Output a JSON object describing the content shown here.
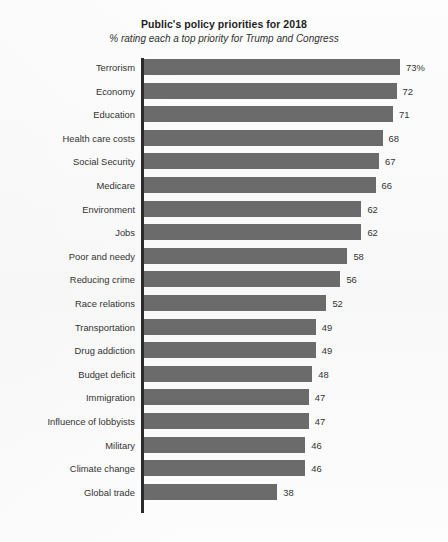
{
  "chart_data": {
    "type": "bar",
    "title": "Public's policy priorities for 2018",
    "subtitle": "% rating each a top priority for Trump and Congress",
    "orientation": "horizontal",
    "xlabel": "",
    "ylabel": "",
    "xlim": [
      0,
      73
    ],
    "grid": false,
    "legend": null,
    "bar_color": "#6b6b6b",
    "axis_color": "#2b2b2b",
    "categories": [
      "Terrorism",
      "Economy",
      "Education",
      "Health care costs",
      "Social Security",
      "Medicare",
      "Environment",
      "Jobs",
      "Poor and needy",
      "Reducing crime",
      "Race relations",
      "Transportation",
      "Drug addiction",
      "Budget deficit",
      "Immigration",
      "Influence of lobbyists",
      "Military",
      "Climate change",
      "Global trade"
    ],
    "values": [
      73,
      72,
      71,
      68,
      67,
      66,
      62,
      62,
      58,
      56,
      52,
      49,
      49,
      48,
      47,
      47,
      46,
      46,
      38
    ],
    "value_labels": [
      "73%",
      "72",
      "71",
      "68",
      "67",
      "66",
      "62",
      "62",
      "58",
      "56",
      "52",
      "49",
      "49",
      "48",
      "47",
      "47",
      "46",
      "46",
      "38"
    ]
  }
}
